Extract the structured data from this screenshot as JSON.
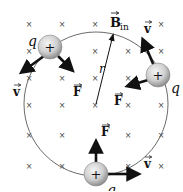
{
  "diagram": {
    "field": {
      "label_main": "B",
      "label_sub": "in",
      "symbol": "×",
      "direction": "into page",
      "grid_columns_x": [
        29,
        62,
        95,
        128,
        161
      ],
      "grid_rows_y": [
        24,
        51,
        78,
        105,
        135,
        166
      ]
    },
    "orbit": {
      "center": [
        96,
        104
      ],
      "radius": 72,
      "radius_label": "r",
      "stroke": "#555555"
    },
    "charges": [
      {
        "id": "charge-top-left",
        "sign": "+",
        "label": "q",
        "pos": [
          50,
          47
        ],
        "velocity_label": "v",
        "force_label": "F"
      },
      {
        "id": "charge-right",
        "sign": "+",
        "label": "q",
        "pos": [
          158,
          75
        ],
        "velocity_label": "v",
        "force_label": "F"
      },
      {
        "id": "charge-bottom",
        "sign": "+",
        "label": "q",
        "pos": [
          96,
          174
        ],
        "velocity_label": "v",
        "force_label": "F"
      }
    ],
    "colors": {
      "charge_fill_light": "#f2f2f2",
      "charge_fill_dark": "#9a9a9a",
      "arrow": "#111111",
      "background": "#ffffff"
    }
  }
}
